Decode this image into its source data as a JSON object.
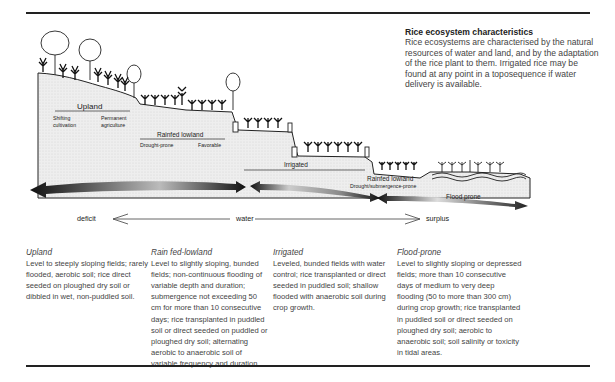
{
  "intro": {
    "title": "Rice ecosystem characteristics",
    "body": "Rice ecosystems are characterised by the natural resources of water and land, and by the adaptation of the rice plant to them. Irrigated rice may be found at any point in a toposequence if water delivery is available."
  },
  "diagram": {
    "labels": {
      "upland": "Upland",
      "shifting": "Shifting",
      "cultivation": "cultivation",
      "permanent": "Permanent",
      "agriculture": "agriculture",
      "rainfed_lowland_1": "Rainfed lowland",
      "drought_prone": "Drought-prone",
      "favorable": "Favorable",
      "irrigated": "Irrigated",
      "rainfed_lowland_2": "Rainfed lowland",
      "drought_submergence": "Drought/submergence-prone",
      "flood_prone": "Flood prone"
    },
    "water_axis": {
      "left": "deficit",
      "center": "water",
      "right": "surplus"
    }
  },
  "columns": [
    {
      "heading": "Upland",
      "text": "Level to steeply sloping fields; rarely flooded, aerobic soil; rice direct seeded on ploughed dry soil or dibbled in wet, non-puddled soil."
    },
    {
      "heading": "Rain fed-lowland",
      "text": "Level to slightly sloping, bunded fields; non-continuous flooding of variable depth and duration; submergence not exceeding 50 cm for more than 10 consecutive days; rice transplanted in puddled soil or direct seeded on puddled or ploughed dry soil; alternating aerobic to anaerobic soil of variable frequency and duration."
    },
    {
      "heading": "Irrigated",
      "text": "Leveled, bunded fields with water control; rice transplanted or direct seeded in puddled soil; shallow flooded with anaerobic soil during crop growth."
    },
    {
      "heading": "Flood-prone",
      "text": "Level to slightly sloping or depressed fields; more than 10 consecutive days of medium to very deep flooding (50 to more than 300 cm) during crop growth; rice transplanted in puddled soil or direct seeded on ploughed dry soil; aerobic to anaerobic soil; soil salinity or toxicity in tidal areas."
    }
  ]
}
